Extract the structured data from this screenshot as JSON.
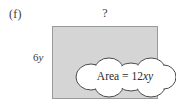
{
  "figure": {
    "part_label": "(f)",
    "edge_fragment": ")",
    "width_label": "?",
    "height_label_coefficient": "6",
    "height_label_variable": "y",
    "callout": {
      "prefix": "Area = 12",
      "variables": "xy",
      "full_text": "Area = 12xy"
    },
    "colors": {
      "rectangle_fill": "#d5d5d5",
      "rectangle_stroke": "#9a9a9a",
      "callout_fill": "#ffffff",
      "callout_stroke": "#4a4a4a",
      "text": "#2b2b2b",
      "background": "#ffffff"
    }
  }
}
